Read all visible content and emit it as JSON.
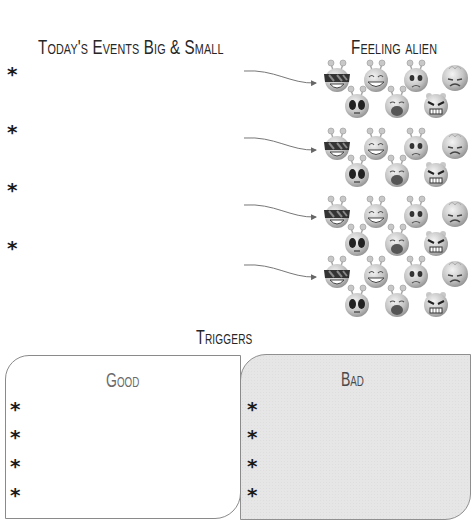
{
  "worksheet": {
    "events_section": {
      "title": "Today's Events Big & Small",
      "bullets": [
        "*",
        "*",
        "*",
        "*"
      ]
    },
    "feelings_section": {
      "title": "Feeling alien",
      "groups": [
        {
          "faces": [
            "cool-sunglasses",
            "laughing",
            "worried",
            "sad-frown",
            "shocked",
            "crying",
            "angry"
          ]
        },
        {
          "faces": [
            "cool-sunglasses",
            "laughing",
            "worried",
            "sad-frown",
            "shocked",
            "crying",
            "angry"
          ]
        },
        {
          "faces": [
            "cool-sunglasses",
            "laughing",
            "worried",
            "sad-frown",
            "shocked",
            "crying",
            "angry"
          ]
        },
        {
          "faces": [
            "cool-sunglasses",
            "laughing",
            "worried",
            "sad-frown",
            "shocked",
            "crying",
            "angry"
          ]
        }
      ]
    },
    "triggers_section": {
      "title": "Triggers",
      "good": {
        "title": "Good",
        "bullets": [
          "*",
          "*",
          "*",
          "*"
        ]
      },
      "bad": {
        "title": "Bad",
        "bullets": [
          "*",
          "*",
          "*",
          "*"
        ]
      }
    },
    "colors": {
      "ink": "#262626",
      "bad_box_fill": "#e6e6e6",
      "box_border": "#8a8a8a",
      "face_gray": "#bdbdbd"
    }
  }
}
